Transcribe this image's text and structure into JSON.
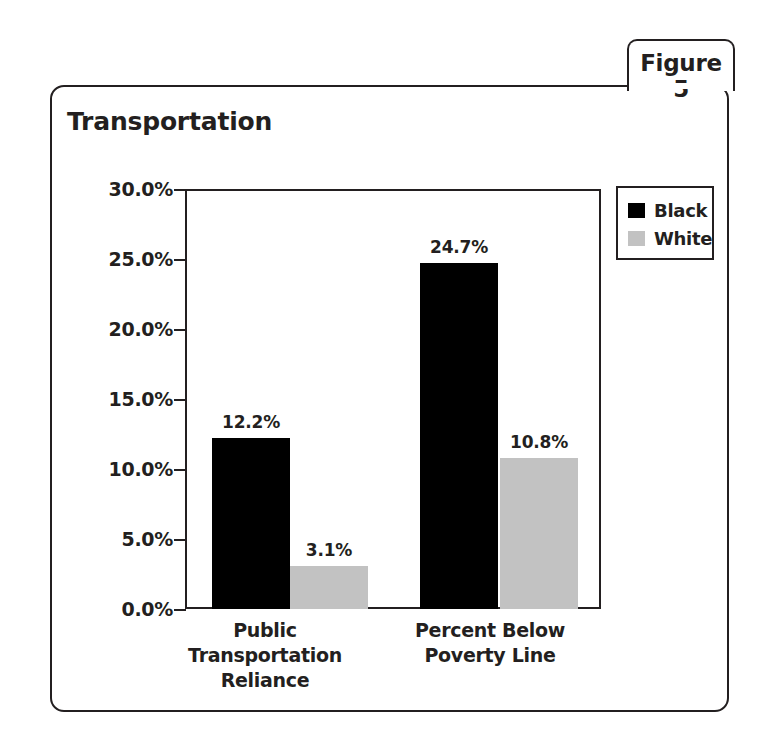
{
  "figure": {
    "tab_label": "Figure 5",
    "title": "Transportation"
  },
  "legend": {
    "position": "top-right-outside",
    "entries": [
      {
        "label": "Black",
        "color": "#000000",
        "swatch": "black-swatch"
      },
      {
        "label": "White",
        "color": "#c2c2c2",
        "swatch": "white-swatch"
      }
    ]
  },
  "axis": {
    "y_ticks": [
      "30.0%",
      "25.0%",
      "20.0%",
      "15.0%",
      "10.0%",
      "5.0%",
      "0.0%"
    ],
    "y_values": [
      30.0,
      25.0,
      20.0,
      15.0,
      10.0,
      5.0,
      0.0
    ]
  },
  "categories": [
    {
      "line1": "Public Transportation",
      "line2": "Reliance"
    },
    {
      "line1": "Percent Below",
      "line2": "Poverty Line"
    }
  ],
  "bars": [
    {
      "id": "pt-black",
      "label": "12.2%",
      "value": 12.2,
      "series": "Black",
      "category": 0
    },
    {
      "id": "pt-white",
      "label": "3.1%",
      "value": 3.1,
      "series": "White",
      "category": 0
    },
    {
      "id": "pv-black",
      "label": "24.7%",
      "value": 24.7,
      "series": "Black",
      "category": 1
    },
    {
      "id": "pv-white",
      "label": "10.8%",
      "value": 10.8,
      "series": "White",
      "category": 1
    }
  ],
  "chart_data": {
    "type": "bar",
    "title": "Transportation",
    "subtitle": "",
    "xlabel": "",
    "ylabel": "",
    "categories": [
      "Public Transportation Reliance",
      "Percent Below Poverty Line"
    ],
    "series": [
      {
        "name": "Black",
        "values": [
          12.2,
          10.8
        ],
        "color": "#000000"
      },
      {
        "name": "White",
        "values": [
          3.1,
          10.8
        ],
        "color": "#c2c2c2"
      }
    ],
    "series_corrected": [
      {
        "name": "Black",
        "values": [
          12.2,
          24.7
        ],
        "color": "#000000"
      },
      {
        "name": "White",
        "values": [
          3.1,
          10.8
        ],
        "color": "#c2c2c2"
      }
    ],
    "data_labels": [
      "12.2%",
      "3.1%",
      "24.7%",
      "10.8%"
    ],
    "ylim": [
      0.0,
      30.0
    ],
    "ytick_step": 5.0,
    "ytick_labels": [
      "0.0%",
      "5.0%",
      "10.0%",
      "15.0%",
      "20.0%",
      "25.0%",
      "30.0%"
    ],
    "yaxis_format": "percent_one_decimal",
    "grid": false,
    "legend_position": "upper right, outside plot area",
    "value_labels_shown": true
  },
  "colors": {
    "ink": "#231f20",
    "black_series": "#000000",
    "white_series": "#c2c2c2",
    "background": "#ffffff"
  }
}
